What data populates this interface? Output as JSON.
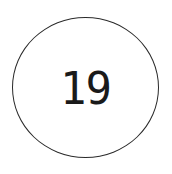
{
  "badge": {
    "value": "19",
    "border_color": "#2a2a2a",
    "text_color": "#1a1a1a",
    "background": "#ffffff"
  }
}
